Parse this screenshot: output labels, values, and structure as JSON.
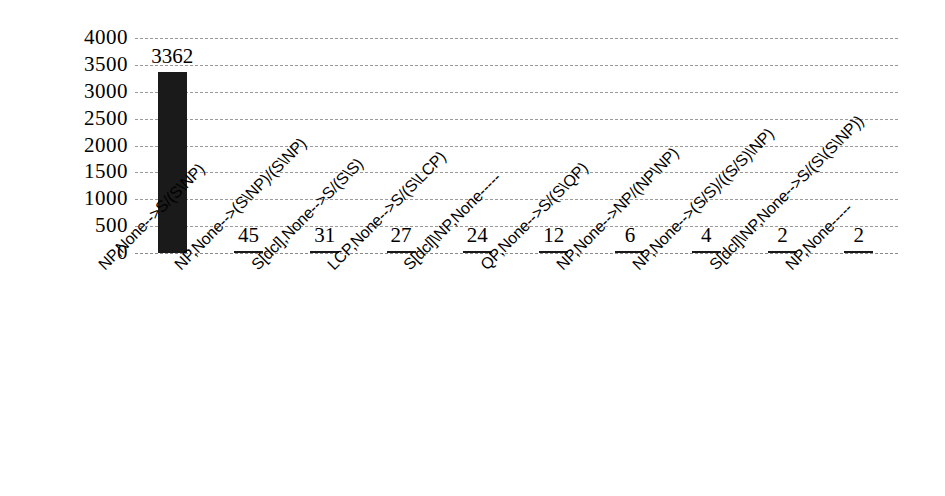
{
  "chart_data": {
    "type": "bar",
    "title": "",
    "xlabel": "",
    "ylabel": "",
    "ylim": [
      0,
      4000
    ],
    "ytick_step": 500,
    "grid": true,
    "legend": "none",
    "orientation": "vertical",
    "bar_color": "#1a1a1a",
    "gridline_color": "#9a9a9a",
    "yticks": [
      "4000",
      "3500",
      "3000",
      "2500",
      "2000",
      "1500",
      "1000",
      "500",
      "0"
    ],
    "categories": [
      "NP,None-->S/(S\\NP)",
      "NP,None-->(S\\NP)/(S\\NP)",
      "S[dcl],None-->S/(S\\S)",
      "LCP,None-->S/(S\\LCP)",
      "S[dcl]\\NP,None-----",
      "QP,None-->S/(S\\QP)",
      "NP,None-->NP/(NP\\NP)",
      "NP,None-->(S/S)/((S/S)\\NP)",
      "S[dcl]\\NP,None-->S/(S\\(S\\NP))",
      "NP,None-----"
    ],
    "values": [
      3362,
      45,
      31,
      27,
      24,
      12,
      6,
      4,
      2,
      2
    ],
    "value_labels": [
      "3362",
      "45",
      "31",
      "27",
      "24",
      "12",
      "6",
      "4",
      "2",
      "2"
    ]
  }
}
